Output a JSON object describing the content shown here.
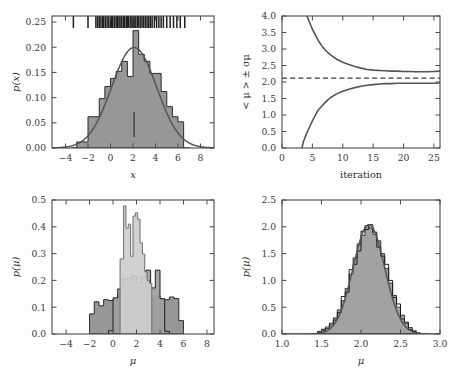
{
  "figure": {
    "title": "",
    "panels": [
      "top-left",
      "top-right",
      "bottom-left",
      "bottom-right"
    ]
  },
  "colors": {
    "hist_fill_dark": "#8e8e8e",
    "hist_edge_dark": "#2b2b2b",
    "hist_fill_mid": "#a8a8a8",
    "hist_fill_light": "#c9c9c9",
    "curve": "#555555",
    "axis": "#4a4a4a",
    "dashed": "#3b3b3b",
    "background": "#fdfdfd"
  },
  "chart_data": [
    {
      "id": "top-left",
      "type": "bar",
      "title": "",
      "xlabel": "x",
      "ylabel": "p(x)",
      "xlim": [
        -5.2,
        9.2
      ],
      "ylim": [
        0.0,
        0.262
      ],
      "xticks": [
        -4,
        -2,
        0,
        2,
        4,
        6,
        8
      ],
      "xticklabels": [
        "-4",
        "-2",
        "0",
        "2",
        "4",
        "6",
        "8"
      ],
      "yticks": [
        0.0,
        0.05,
        0.1,
        0.15,
        0.2,
        0.25
      ],
      "yticklabels": [
        "0.00",
        "0.05",
        "0.10",
        "0.15",
        "0.20",
        "0.25"
      ],
      "grid": false,
      "bin_edges": [
        -3.5,
        -3.0,
        -2.5,
        -2.0,
        -1.5,
        -1.0,
        -0.5,
        0.0,
        0.5,
        1.0,
        1.5,
        2.0,
        2.5,
        3.0,
        3.5,
        4.0,
        4.5,
        5.0,
        5.5,
        6.0,
        6.5,
        7.0
      ],
      "values": [
        0.0,
        0.012,
        0.012,
        0.062,
        0.062,
        0.098,
        0.122,
        0.138,
        0.152,
        0.172,
        0.142,
        0.233,
        0.186,
        0.172,
        0.148,
        0.148,
        0.112,
        0.082,
        0.062,
        0.052,
        0.0
      ],
      "curve": {
        "name": "gaussian fit",
        "mean": 2.1,
        "sigma": 2.0,
        "amplitude": 0.1995
      },
      "rug": {
        "name": "data-rug",
        "y_frac": 0.955,
        "points": [
          -3.3,
          -2.0,
          -1.3,
          -1.15,
          -1.0,
          -0.85,
          -0.7,
          -0.6,
          -0.45,
          -0.3,
          -0.15,
          0.0,
          0.1,
          0.2,
          0.35,
          0.5,
          0.6,
          0.75,
          0.85,
          1.0,
          1.15,
          1.25,
          1.4,
          1.5,
          1.6,
          1.75,
          1.9,
          2.0,
          2.1,
          2.25,
          2.4,
          2.5,
          2.65,
          2.8,
          2.95,
          3.1,
          3.25,
          3.4,
          3.55,
          3.7,
          3.9,
          4.1,
          4.3,
          4.5,
          4.7,
          5.0,
          5.3,
          5.6,
          5.9,
          6.2,
          6.6
        ]
      },
      "marker": {
        "name": "mean-marker",
        "x": 2.1,
        "y0": 0.022,
        "y1": 0.072
      }
    },
    {
      "id": "top-right",
      "type": "line",
      "title": "",
      "xlabel": "iteration",
      "ylabel": "< μ > ± σμ",
      "xlim": [
        0,
        26
      ],
      "ylim": [
        0.0,
        4.0
      ],
      "xticks": [
        0,
        5,
        10,
        15,
        20,
        25
      ],
      "xticklabels": [
        "0",
        "5",
        "10",
        "15",
        "20",
        "25"
      ],
      "yticks": [
        0.0,
        0.5,
        1.0,
        1.5,
        2.0,
        2.5,
        3.0,
        3.5,
        4.0
      ],
      "yticklabels": [
        "0.0",
        "0.5",
        "1.0",
        "1.5",
        "2.0",
        "2.5",
        "3.0",
        "3.5",
        "4.0"
      ],
      "grid": false,
      "hline": {
        "name": "true-mu-line",
        "y": 2.12,
        "style": "dashed"
      },
      "series": [
        {
          "name": "upper bound",
          "x": [
            3,
            3.5,
            4,
            4.5,
            5,
            5.5,
            6,
            6.5,
            7,
            7.5,
            8,
            9,
            10,
            11,
            12,
            13,
            14,
            15,
            16,
            17,
            18,
            19,
            20,
            21,
            22,
            23,
            24,
            25,
            26
          ],
          "values": [
            4.55,
            4.3,
            4.05,
            3.82,
            3.6,
            3.42,
            3.25,
            3.11,
            2.99,
            2.9,
            2.82,
            2.69,
            2.6,
            2.53,
            2.47,
            2.42,
            2.38,
            2.36,
            2.35,
            2.34,
            2.33,
            2.33,
            2.32,
            2.32,
            2.31,
            2.31,
            2.31,
            2.32,
            2.33
          ]
        },
        {
          "name": "lower bound",
          "x": [
            3,
            3.5,
            4,
            4.5,
            5,
            5.5,
            6,
            6.5,
            7,
            7.5,
            8,
            9,
            10,
            11,
            12,
            13,
            14,
            15,
            16,
            17,
            18,
            19,
            20,
            21,
            22,
            23,
            24,
            25,
            26
          ],
          "values": [
            -0.25,
            0.18,
            0.42,
            0.62,
            0.82,
            1.0,
            1.16,
            1.26,
            1.36,
            1.45,
            1.53,
            1.64,
            1.72,
            1.78,
            1.83,
            1.87,
            1.9,
            1.92,
            1.94,
            1.95,
            1.95,
            1.96,
            1.96,
            1.96,
            1.96,
            1.96,
            1.96,
            1.96,
            1.97
          ]
        }
      ]
    },
    {
      "id": "bottom-left",
      "type": "bar",
      "title": "",
      "xlabel": "μ",
      "ylabel": "p(μ)",
      "xlim": [
        -5.2,
        8.6
      ],
      "ylim": [
        0.0,
        0.5
      ],
      "xticks": [
        -4,
        -2,
        0,
        2,
        4,
        6,
        8
      ],
      "xticklabels": [
        "-4",
        "-2",
        "0",
        "2",
        "4",
        "6",
        "8"
      ],
      "yticks": [
        0.0,
        0.1,
        0.2,
        0.3,
        0.4,
        0.5
      ],
      "yticklabels": [
        "0.0",
        "0.1",
        "0.2",
        "0.3",
        "0.4",
        "0.5"
      ],
      "grid": false,
      "series": [
        {
          "name": "wide prior posterior",
          "fill": "#8e8e8e",
          "edge": "#2b2b2b",
          "bin_edges": [
            -2.0,
            -1.6,
            -1.2,
            -0.8,
            -0.4,
            0.0,
            0.4,
            0.8,
            1.2,
            1.6,
            2.0,
            2.4,
            2.8,
            3.2,
            3.6,
            4.0,
            4.4,
            4.8,
            5.2,
            5.6,
            6.0
          ],
          "values": [
            0.075,
            0.12,
            0.105,
            0.128,
            0.125,
            0.128,
            0.148,
            0.148,
            0.138,
            0.142,
            0.148,
            0.152,
            0.148,
            0.135,
            0.142,
            0.128,
            0.128,
            0.138,
            0.132,
            0.05
          ]
        },
        {
          "name": "medium prior posterior",
          "fill": "#a0a0a0",
          "edge": "#1f1f1f",
          "bin_edges": [
            -0.4,
            0.0,
            0.4,
            0.8,
            1.2,
            1.6,
            2.0,
            2.4,
            2.8,
            3.2,
            3.6,
            4.0,
            4.4,
            4.8
          ],
          "values": [
            0.012,
            0.135,
            0.168,
            0.205,
            0.208,
            0.218,
            0.192,
            0.215,
            0.238,
            0.172,
            0.238,
            0.132,
            0.01
          ]
        },
        {
          "name": "narrow prior posterior",
          "fill": "#cdcdcd",
          "edge": "#6e6e6e",
          "bin_edges": [
            0.6,
            0.9,
            1.1,
            1.3,
            1.5,
            1.7,
            1.9,
            2.1,
            2.3,
            2.5,
            2.7,
            2.9,
            3.1,
            3.3
          ],
          "values": [
            0.28,
            0.478,
            0.395,
            0.41,
            0.29,
            0.44,
            0.452,
            0.428,
            0.34,
            0.298,
            0.232,
            0.2,
            0.19
          ]
        }
      ]
    },
    {
      "id": "bottom-right",
      "type": "bar",
      "title": "",
      "xlabel": "μ",
      "ylabel": "p(μ)",
      "xlim": [
        1.0,
        3.0
      ],
      "ylim": [
        0.0,
        2.5
      ],
      "xticks": [
        1.0,
        1.5,
        2.0,
        2.5,
        3.0
      ],
      "xticklabels": [
        "1.0",
        "1.5",
        "2.0",
        "2.5",
        "3.0"
      ],
      "yticks": [
        0.0,
        0.5,
        1.0,
        1.5,
        2.0,
        2.5
      ],
      "yticklabels": [
        "0.0",
        "0.5",
        "1.0",
        "1.5",
        "2.0",
        "2.5"
      ],
      "grid": false,
      "series": [
        {
          "name": "posterior sample A",
          "fill": "#9a9a9a",
          "edge": "#3a3a3a",
          "bin_edges": [
            1.45,
            1.5,
            1.55,
            1.6,
            1.65,
            1.7,
            1.75,
            1.8,
            1.85,
            1.9,
            1.95,
            2.0,
            2.05,
            2.1,
            2.15,
            2.2,
            2.25,
            2.3,
            2.35,
            2.4,
            2.45,
            2.5,
            2.55,
            2.6,
            2.65,
            2.7,
            2.75
          ],
          "values": [
            0.05,
            0.09,
            0.1,
            0.17,
            0.3,
            0.45,
            0.62,
            0.85,
            1.12,
            1.42,
            1.68,
            1.84,
            2.02,
            1.98,
            1.86,
            1.74,
            1.5,
            1.22,
            0.95,
            0.72,
            0.5,
            0.35,
            0.2,
            0.12,
            0.06,
            0.02
          ]
        },
        {
          "name": "posterior sample B",
          "fill": "none",
          "edge": "#1c1c1c",
          "bin_edges": [
            1.45,
            1.5,
            1.55,
            1.6,
            1.65,
            1.7,
            1.75,
            1.8,
            1.85,
            1.9,
            1.95,
            2.0,
            2.05,
            2.1,
            2.15,
            2.2,
            2.25,
            2.3,
            2.35,
            2.4,
            2.45,
            2.5,
            2.55,
            2.6,
            2.65,
            2.7,
            2.75
          ],
          "values": [
            0.03,
            0.07,
            0.13,
            0.2,
            0.26,
            0.4,
            0.7,
            0.78,
            1.2,
            1.3,
            1.55,
            1.92,
            1.95,
            2.04,
            1.9,
            1.62,
            1.45,
            1.3,
            1.0,
            0.68,
            0.56,
            0.28,
            0.22,
            0.08,
            0.04,
            0.01
          ]
        }
      ],
      "curve": {
        "name": "gaussian fit",
        "mean": 2.1,
        "sigma": 0.2,
        "amplitude": 2.04
      }
    }
  ]
}
